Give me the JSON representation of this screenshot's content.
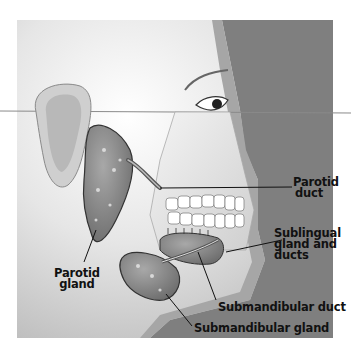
{
  "figure": {
    "colors": {
      "background_dark": "#7f7f7f",
      "skin_light": "#f2f2f2",
      "gland_fill": "#8a8a8a",
      "label_text": "#111111",
      "page_bg": "#ffffff"
    }
  },
  "labels": {
    "parotid_duct": {
      "line1": "Parotid",
      "line2": "duct"
    },
    "sublingual": {
      "line1": "Sublingual",
      "line2": "gland and",
      "line3": "ducts"
    },
    "parotid_gland": {
      "line1": "Parotid",
      "line2": "gland"
    },
    "submandibular_duct": {
      "text": "Submandibular duct"
    },
    "submandibular_gland": {
      "text": "Submandibular gland"
    }
  }
}
